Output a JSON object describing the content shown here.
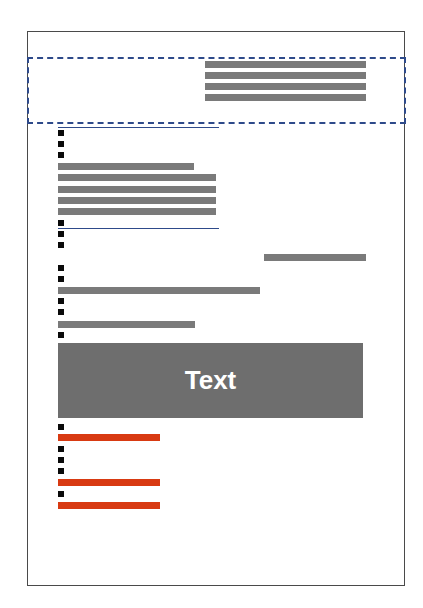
{
  "diagram": {
    "type": "document-layout-wireframe",
    "colors": {
      "page_border": "#4a4a4a",
      "highlight_dashed_border": "#2e4a8a",
      "text_placeholder": "#7a7a7a",
      "emphasis_placeholder": "#d83a12",
      "bullet": "#0a0a0a",
      "block_fill": "#6e6e6e",
      "block_text": "#ffffff"
    },
    "header_region": {
      "highlighted": true,
      "text_lines": 4
    },
    "block": {
      "label": "Text"
    },
    "counts": {
      "bullets": 15,
      "gray_lines": 13,
      "red_lines": 3,
      "rule_lines": 2
    }
  }
}
